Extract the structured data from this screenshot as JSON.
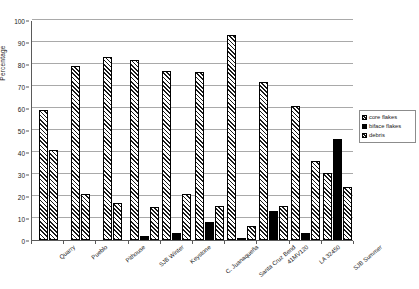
{
  "chart_data": {
    "type": "bar",
    "title": "",
    "xlabel": "",
    "ylabel": "Percentage",
    "ylim": [
      0,
      100
    ],
    "yticks": [
      0,
      10,
      20,
      30,
      40,
      50,
      60,
      70,
      80,
      90,
      100
    ],
    "grid": true,
    "legend_position": "right",
    "categories": [
      "Quarry",
      "Pueblo",
      "Pithouse",
      "SJB Winter",
      "Keystone",
      "C. Juanaqueña",
      "Santa Cruz Bend",
      "41MV120",
      "LA 32450",
      "SJB Summer"
    ],
    "series": [
      {
        "name": "core flakes",
        "pattern": "diagonal-hatch",
        "color": "#1a1a1a",
        "values": [
          59,
          79,
          83,
          82,
          77,
          76.5,
          93,
          72,
          61,
          30.5
        ]
      },
      {
        "name": "biface flakes",
        "pattern": "solid",
        "color": "#000000",
        "values": [
          0,
          0,
          0,
          2,
          3,
          8,
          0.5,
          13,
          3,
          46
        ]
      },
      {
        "name": "debris",
        "pattern": "diagonal-hatch",
        "color": "#1a1a1a",
        "values": [
          41,
          21,
          17,
          15,
          21,
          15.5,
          6.5,
          15.5,
          36,
          24
        ]
      }
    ]
  },
  "legend": {
    "items": [
      {
        "label": "core flakes"
      },
      {
        "label": "biface flakes"
      },
      {
        "label": "debris"
      }
    ]
  },
  "colors": {
    "axis": "#5a5a5a",
    "gridline": "#a9a9a9",
    "hatch": "#1a1a1a",
    "solid": "#000000",
    "background": "#ffffff"
  }
}
